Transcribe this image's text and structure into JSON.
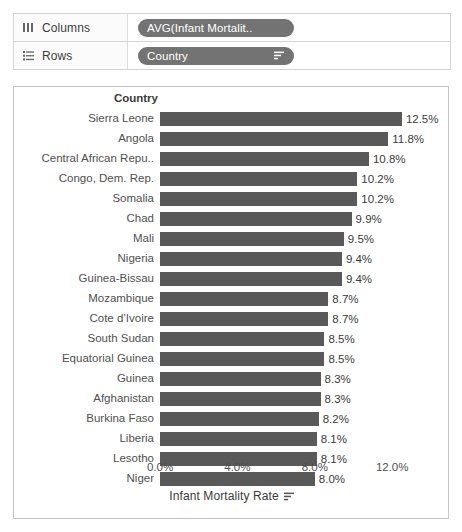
{
  "shelves": [
    {
      "icon": "columns-icon",
      "label": "Columns",
      "pill": {
        "text": "AVG(Infant Mortalit..",
        "has_sort_icon": false
      }
    },
    {
      "icon": "rows-icon",
      "label": "Rows",
      "pill": {
        "text": "Country",
        "has_sort_icon": true
      }
    }
  ],
  "chart_data": {
    "type": "bar",
    "orientation": "horizontal",
    "title": "",
    "row_header": "Country",
    "xlabel": "Infant Mortality Rate",
    "ylabel": "Country",
    "xlim": [
      0,
      13.0
    ],
    "xticks": [
      "0.0%",
      "4.0%",
      "8.0%",
      "12.0%"
    ],
    "xtick_values": [
      0,
      4,
      8,
      12
    ],
    "grid": false,
    "legend": "none",
    "bar_color": "#595959",
    "axis_sort_icon": true,
    "categories": [
      "Sierra Leone",
      "Angola",
      "Central African Repu..",
      "Congo, Dem. Rep.",
      "Somalia",
      "Chad",
      "Mali",
      "Nigeria",
      "Guinea-Bissau",
      "Mozambique",
      "Cote d’Ivoire",
      "South Sudan",
      "Equatorial Guinea",
      "Guinea",
      "Afghanistan",
      "Burkina Faso",
      "Liberia",
      "Lesotho",
      "Niger"
    ],
    "values": [
      12.5,
      11.8,
      10.8,
      10.2,
      10.2,
      9.9,
      9.5,
      9.4,
      9.4,
      8.7,
      8.7,
      8.5,
      8.5,
      8.3,
      8.3,
      8.2,
      8.1,
      8.1,
      8.0
    ],
    "labels": [
      "12.5%",
      "11.8%",
      "10.8%",
      "10.2%",
      "10.2%",
      "9.9%",
      "9.5%",
      "9.4%",
      "9.4%",
      "8.7%",
      "8.7%",
      "8.5%",
      "8.5%",
      "8.3%",
      "8.3%",
      "8.2%",
      "8.1%",
      "8.1%",
      "8.0%"
    ]
  }
}
